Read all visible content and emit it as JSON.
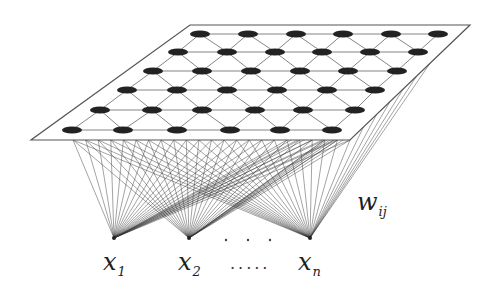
{
  "diagram": {
    "plane": {
      "corners": [
        [
          190,
          25
        ],
        [
          470,
          25
        ],
        [
          350,
          140
        ],
        [
          31,
          140
        ]
      ],
      "stroke": "#555555"
    },
    "nodes": {
      "rows": [
        {
          "y": 34,
          "x": [
            200,
            248,
            296,
            343,
            391,
            438
          ]
        },
        {
          "y": 52,
          "x": [
            178,
            227,
            275,
            322,
            370,
            418
          ]
        },
        {
          "y": 71,
          "x": [
            153,
            202,
            251,
            300,
            348,
            397
          ]
        },
        {
          "y": 90,
          "x": [
            127,
            177,
            227,
            277,
            327,
            375
          ]
        },
        {
          "y": 110,
          "x": [
            100,
            152,
            202,
            255,
            303,
            355
          ]
        },
        {
          "y": 130,
          "x": [
            72,
            123,
            177,
            230,
            280,
            332
          ]
        }
      ],
      "color": "#222222"
    },
    "inputs": [
      {
        "id": "x1",
        "x": 114,
        "y": 238,
        "label": "x",
        "sub": "1"
      },
      {
        "id": "x2",
        "x": 189,
        "y": 238,
        "label": "x",
        "sub": "2"
      },
      {
        "id": "xn",
        "x": 310,
        "y": 238,
        "label": "x",
        "sub": "n"
      }
    ],
    "ellipsis_between_nodes": "· · ·",
    "ellipsis_between_labels": ".....",
    "weight_label": {
      "text": "w",
      "sub": "ij"
    }
  }
}
